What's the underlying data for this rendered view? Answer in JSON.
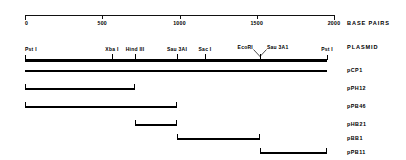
{
  "figure": {
    "kind": "restriction-map",
    "axis": {
      "title": "BASE PAIRS",
      "units": "bp",
      "min": 0,
      "max": 2000,
      "ticks": [
        {
          "value": 0,
          "label": "0"
        },
        {
          "value": 500,
          "label": "500"
        },
        {
          "value": 1000,
          "label": "1000"
        },
        {
          "value": 1500,
          "label": "1500"
        },
        {
          "value": 2000,
          "label": "2000"
        }
      ]
    },
    "map": {
      "title": "PLASMID",
      "start": 0,
      "end": 1955,
      "sites": [
        {
          "name": "Pst I",
          "position": 0,
          "label": "Pst I",
          "anchor": "left",
          "pointer": false
        },
        {
          "name": "Xba I",
          "position": 563,
          "label": "Xba I",
          "anchor": "center",
          "pointer": false
        },
        {
          "name": "Hind III",
          "position": 712,
          "label": "Hind III",
          "anchor": "center",
          "pointer": false
        },
        {
          "name": "Sau 3AI",
          "position": 984,
          "label": "Sau 3AI",
          "anchor": "center",
          "pointer": false
        },
        {
          "name": "Sac I",
          "position": 1165,
          "label": "Sac I",
          "anchor": "center",
          "pointer": false
        },
        {
          "name": "EcoRI",
          "position": 1521,
          "label": "EcoRI",
          "anchor": "right",
          "pointer": true
        },
        {
          "name": "Sau 3A1",
          "position": 1521,
          "label": "Sau 3A1",
          "anchor": "left",
          "pointer": true
        },
        {
          "name": "Pst I",
          "position": 1955,
          "label": "Pst I",
          "anchor": "center",
          "pointer": false
        }
      ]
    },
    "fragments": [
      {
        "name": "pCP1",
        "label": "pCP1",
        "start": 0,
        "end": 1955,
        "caps": "none"
      },
      {
        "name": "pPH12",
        "label": "pPH12",
        "start": 0,
        "end": 712,
        "caps": "both"
      },
      {
        "name": "pPB46",
        "label": "pPB46",
        "start": 0,
        "end": 984,
        "caps": "both"
      },
      {
        "name": "pHB21",
        "label": "pHB21",
        "start": 712,
        "end": 984,
        "caps": "both"
      },
      {
        "name": "pBB1",
        "label": "pBB1",
        "start": 984,
        "end": 1521,
        "caps": "both"
      },
      {
        "name": "pPB11",
        "label": "pPB11",
        "start": 1521,
        "end": 1955,
        "caps": "both"
      }
    ]
  },
  "colors": {
    "ink": "#000000",
    "background": "#ffffff"
  }
}
